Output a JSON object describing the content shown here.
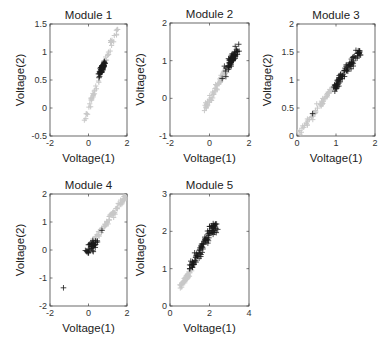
{
  "figure": {
    "xlabel": "Voltage(1)",
    "ylabel": "Voltage(2)",
    "background": "#ffffff",
    "colors": {
      "highlight": "#1a1a1a",
      "background_points": "#c8c8c8"
    }
  },
  "chart_data": [
    {
      "type": "scatter",
      "title": "Module 1",
      "xlabel": "Voltage(1)",
      "ylabel": "Voltage(2)",
      "xlim": [
        -2,
        2
      ],
      "ylim": [
        -0.5,
        1.5
      ],
      "xticks": [
        -2,
        0,
        2
      ],
      "yticks": [
        -0.5,
        0,
        0.5,
        1,
        1.5
      ],
      "ytick_labels": [
        "-0.5",
        "0",
        "0.5",
        "1",
        "1.5"
      ],
      "grid": false,
      "series": [
        {
          "name": "background",
          "marker": "+",
          "color": "#c8c8c8",
          "line": {
            "x0": -0.3,
            "y0": -0.3,
            "x1": 1.6,
            "y1": 1.55
          },
          "count": 60
        },
        {
          "name": "module",
          "marker": "+",
          "color": "#1a1a1a",
          "cluster": {
            "cx": 0.7,
            "cy": 0.7,
            "sx": 0.08,
            "sy": 0.07
          },
          "count": 60
        }
      ]
    },
    {
      "type": "scatter",
      "title": "Module 2",
      "xlabel": "Voltage(1)",
      "ylabel": "Voltage(2)",
      "xlim": [
        -2,
        2
      ],
      "ylim": [
        -1,
        2
      ],
      "xticks": [
        -2,
        0,
        2
      ],
      "yticks": [
        -1,
        0,
        1,
        2
      ],
      "ytick_labels": [
        "-1",
        "0",
        "1",
        "2"
      ],
      "grid": false,
      "series": [
        {
          "name": "background",
          "marker": "+",
          "color": "#c8c8c8",
          "line": {
            "x0": -0.2,
            "y0": -0.25,
            "x1": 0.9,
            "y1": 0.8
          },
          "count": 70
        },
        {
          "name": "module",
          "marker": "+",
          "color": "#1a1a1a",
          "cluster": {
            "cx": 1.15,
            "cy": 1.05,
            "sx": 0.15,
            "sy": 0.15
          },
          "count": 70
        }
      ]
    },
    {
      "type": "scatter",
      "title": "Module 3",
      "xlabel": "Voltage(1)",
      "ylabel": "Voltage(2)",
      "xlim": [
        0,
        2
      ],
      "ylim": [
        0,
        2
      ],
      "xticks": [
        0,
        1,
        2
      ],
      "yticks": [
        0,
        0.5,
        1,
        1.5,
        2
      ],
      "ytick_labels": [
        "0",
        "0.5",
        "1",
        "1.5",
        "2"
      ],
      "grid": false,
      "series": [
        {
          "name": "background",
          "marker": "+",
          "color": "#c8c8c8",
          "line": {
            "x0": 0.05,
            "y0": 0.05,
            "x1": 0.9,
            "y1": 0.85
          },
          "count": 60
        },
        {
          "name": "module",
          "marker": "+",
          "color": "#1a1a1a",
          "line": {
            "x0": 0.95,
            "y0": 0.85,
            "x1": 1.6,
            "y1": 1.52
          },
          "count": 80,
          "extra_points": [
            [
              0.4,
              0.4
            ],
            [
              0.97,
              0.8
            ],
            [
              1.6,
              1.52
            ]
          ]
        }
      ]
    },
    {
      "type": "scatter",
      "title": "Module 4",
      "xlabel": "Voltage(1)",
      "ylabel": "Voltage(2)",
      "xlim": [
        -2,
        2
      ],
      "ylim": [
        -2,
        2
      ],
      "xticks": [
        -2,
        0,
        2
      ],
      "yticks": [
        -2,
        -1,
        0,
        1,
        2
      ],
      "ytick_labels": [
        "-2",
        "-1",
        "0",
        "1",
        "2"
      ],
      "grid": false,
      "series": [
        {
          "name": "background",
          "marker": "+",
          "color": "#c8c8c8",
          "line": {
            "x0": 0.3,
            "y0": 0.35,
            "x1": 1.95,
            "y1": 1.95
          },
          "count": 70
        },
        {
          "name": "module",
          "marker": "+",
          "color": "#1a1a1a",
          "line": {
            "x0": -0.05,
            "y0": -0.1,
            "x1": 0.3,
            "y1": 0.3
          },
          "count": 40,
          "extra_points": [
            [
              -1.3,
              -1.35
            ],
            [
              0.7,
              0.7
            ]
          ]
        }
      ]
    },
    {
      "type": "scatter",
      "title": "Module 5",
      "xlabel": "Voltage(1)",
      "ylabel": "Voltage(2)",
      "xlim": [
        0,
        4
      ],
      "ylim": [
        0,
        3
      ],
      "xticks": [
        0,
        2,
        4
      ],
      "yticks": [
        0,
        1,
        2,
        3
      ],
      "ytick_labels": [
        "0",
        "1",
        "2",
        "3"
      ],
      "grid": false,
      "series": [
        {
          "name": "background",
          "marker": "+",
          "color": "#c8c8c8",
          "line": {
            "x0": 0.5,
            "y0": 0.5,
            "x1": 1.1,
            "y1": 1.0
          },
          "count": 40
        },
        {
          "name": "module",
          "marker": "+",
          "color": "#1a1a1a",
          "line": {
            "x0": 1.0,
            "y0": 1.0,
            "x1": 2.3,
            "y1": 2.2
          },
          "count": 90,
          "extra_points": [
            [
              1.0,
              1.0
            ],
            [
              2.3,
              2.2
            ],
            [
              2.0,
              1.95
            ]
          ]
        }
      ]
    }
  ],
  "layout": {
    "panels": [
      {
        "left": 50,
        "top": 24,
        "width": 77,
        "height": 112
      },
      {
        "left": 170,
        "top": 23,
        "width": 79,
        "height": 113
      },
      {
        "left": 297,
        "top": 24,
        "width": 78,
        "height": 112
      },
      {
        "left": 50,
        "top": 194,
        "width": 77,
        "height": 112
      },
      {
        "left": 170,
        "top": 194,
        "width": 79,
        "height": 112
      }
    ]
  }
}
